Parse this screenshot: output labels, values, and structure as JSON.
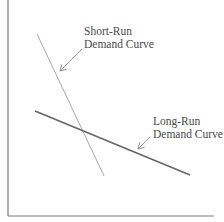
{
  "diagram": {
    "type": "demand-curves",
    "axes": {
      "y_axis": {
        "x": 8,
        "y1": 0,
        "y2": 216
      },
      "x_axis": {
        "y": 216,
        "x1": 8,
        "x2": 214
      },
      "color": "#7a7a7a"
    },
    "curves": [
      {
        "name": "Short-Run Demand Curve",
        "label_line1": "Short-Run",
        "label_line2": "Demand Curve",
        "x1": 37,
        "y1": 34,
        "x2": 104,
        "y2": 176,
        "color": "#a8a8a8",
        "width": 1,
        "arrow": {
          "x1": 82,
          "y1": 49,
          "x2": 60,
          "y2": 71
        }
      },
      {
        "name": "Long-Run Demand Curve",
        "label_line1": "Long-Run",
        "label_line2": "Demand Curve",
        "x1": 35,
        "y1": 111,
        "x2": 190,
        "y2": 175,
        "color": "#666666",
        "width": 1.6,
        "arrow": {
          "x1": 150,
          "y1": 137,
          "x2": 138,
          "y2": 149
        }
      }
    ]
  }
}
